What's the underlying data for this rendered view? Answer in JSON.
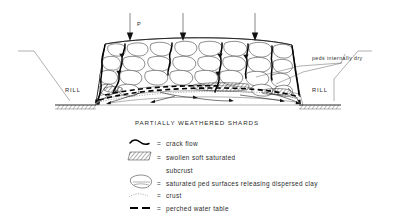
{
  "figure": {
    "title": "PARTIALLY WEATHERED SHARDS",
    "load_label": "P",
    "annotation_peds": "peds internally dry",
    "rill_left": "RILL",
    "rill_right": "RILL",
    "equals_sign": "=",
    "arrow_count": 3
  },
  "legend": {
    "items": [
      {
        "symbol": "crack-flow-squiggle",
        "eq": "=",
        "label": "crack flow"
      },
      {
        "symbol": "hatched-rectangle",
        "eq": "=",
        "label": "swollen soft saturated"
      },
      {
        "symbol": "none",
        "eq": "",
        "label": "subcrust"
      },
      {
        "symbol": "ped-blob",
        "eq": "=",
        "label": "saturated ped surfaces releasing dispersed clay"
      },
      {
        "symbol": "crust-stipple",
        "eq": "=",
        "label": "crust"
      },
      {
        "symbol": "dashed-bar",
        "eq": "=",
        "label": "perched water table"
      }
    ]
  },
  "colors": {
    "ink": "#1a1a1a",
    "background": "#ffffff",
    "heavy": "#000000"
  }
}
